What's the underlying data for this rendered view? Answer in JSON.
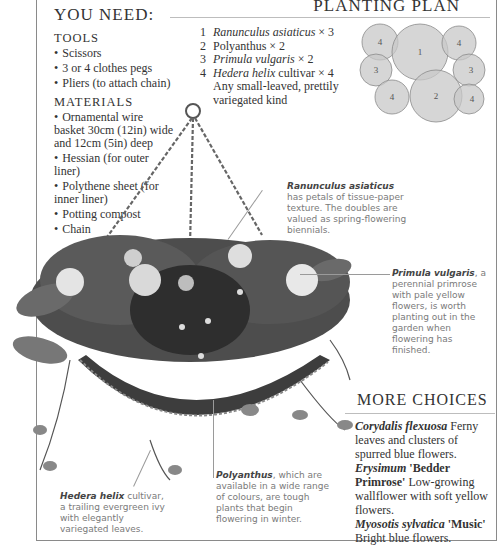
{
  "you_need": {
    "title": "YOU NEED:",
    "tools_heading": "TOOLS",
    "tools": [
      "Scissors",
      "3 or 4 clothes pegs",
      "Pliers (to attach chain)"
    ],
    "materials_heading": "MATERIALS",
    "materials": [
      "Ornamental wire basket 30cm (12in) wide and 12cm (5in) deep",
      "Hessian (for outer liner)",
      "Polythene sheet (for inner liner)",
      "Potting compost",
      "Chain"
    ],
    "bullet": "•"
  },
  "planting_plan": {
    "title": "PLANTING PLAN",
    "items": [
      {
        "num": "1",
        "name": "Ranunculus asiaticus",
        "italic": true,
        "qty": " × 3",
        "note": ""
      },
      {
        "num": "2",
        "name": "Polyanthus",
        "italic": false,
        "qty": " × 2",
        "note": ""
      },
      {
        "num": "3",
        "name": "Primula vulgaris",
        "italic": true,
        "qty": " × 2",
        "note": ""
      },
      {
        "num": "4",
        "name": "Hedera helix",
        "italic": true,
        "qty": " cultivar × 4",
        "note": "Any small-leaved, prettily variegated kind"
      }
    ],
    "diagram_labels": [
      "4",
      "1",
      "4",
      "3",
      "3",
      "4",
      "2",
      "4"
    ]
  },
  "annotations": {
    "ranunculus": {
      "name": "Ranunculus asiaticus",
      "text": " has petals of tissue-paper texture. The doubles are valued as spring-flowering biennials."
    },
    "primula": {
      "name": "Primula vulgaris",
      "text": ", a perennial primrose with pale yellow flowers, is worth planting out in the garden when flowering has finished."
    },
    "polyanthus": {
      "name": "Polyanthus",
      "text": ", which are available in a wide range of colours, are tough plants that begin flowering in winter."
    },
    "hedera": {
      "name": "Hedera helix",
      "text": " cultivar, a trailing evergreen ivy with elegantly variegated leaves."
    }
  },
  "more_choices": {
    "title": "MORE CHOICES",
    "items": [
      {
        "name": "Corydalis flexuosa",
        "cultivar": "",
        "text": " Ferny leaves and clusters of spurred blue flowers."
      },
      {
        "name": "Erysimum",
        "cultivar": " 'Bedder Primrose'",
        "text": " Low-growing wallflower with soft yellow flowers."
      },
      {
        "name": "Myosotis sylvatica",
        "cultivar": " 'Music'",
        "text": " Bright blue flowers."
      }
    ]
  },
  "photo": {
    "subject": "hanging-basket-photo",
    "tone": "grayscale"
  }
}
